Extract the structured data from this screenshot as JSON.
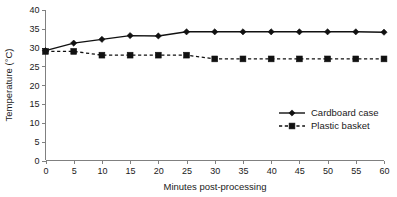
{
  "chart_data": {
    "type": "line",
    "title": "",
    "xlabel": "Minutes post-processing",
    "ylabel": "Temperature (°C)",
    "x": [
      0,
      5,
      10,
      15,
      20,
      25,
      30,
      35,
      40,
      45,
      50,
      55,
      60
    ],
    "xlim": [
      0,
      60
    ],
    "ylim": [
      0,
      40
    ],
    "xticks": [
      "0",
      "5",
      "10",
      "15",
      "20",
      "25",
      "30",
      "35",
      "40",
      "45",
      "50",
      "55",
      "60"
    ],
    "yticks": [
      "0",
      "5",
      "10",
      "15",
      "20",
      "25",
      "30",
      "35",
      "40"
    ],
    "grid": false,
    "legend_position": "center-right",
    "series": [
      {
        "name": "Cardboard case",
        "marker": "diamond",
        "linestyle": "solid",
        "color": "#111111",
        "values": [
          29.2,
          31.2,
          32.2,
          33.2,
          33.1,
          34.2,
          34.2,
          34.2,
          34.2,
          34.2,
          34.2,
          34.2,
          34.1
        ]
      },
      {
        "name": "Plastic basket",
        "marker": "square",
        "linestyle": "dashed",
        "color": "#111111",
        "values": [
          29.0,
          29.0,
          28.0,
          28.0,
          28.0,
          28.0,
          27.0,
          27.0,
          27.0,
          27.0,
          27.0,
          27.0,
          27.0
        ]
      }
    ]
  },
  "axes": {
    "y_axis_label": "Temperature (°C)",
    "x_axis_label": "Minutes post-processing"
  },
  "legend": {
    "items": [
      {
        "label": "Cardboard case"
      },
      {
        "label": "Plastic basket"
      }
    ]
  },
  "colors": {
    "ink": "#111111",
    "axis": "#808080",
    "background": "#ffffff"
  }
}
